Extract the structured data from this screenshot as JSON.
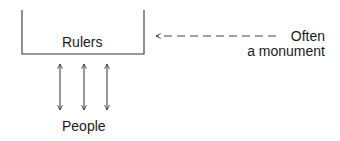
{
  "diagram": {
    "box_label": "Rulers",
    "bottom_label": "People",
    "annotation": {
      "line1": "Often",
      "line2": "a monument"
    },
    "arrow_count": 3,
    "colors": {
      "stroke": "#333333",
      "text": "#1a1a1a",
      "background": "#ffffff"
    }
  }
}
